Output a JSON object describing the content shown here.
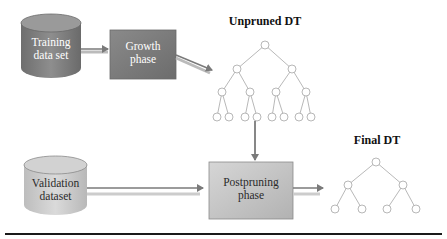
{
  "diagram": {
    "nodes": {
      "training": {
        "label_line1": "Training",
        "label_line2": "data set",
        "shape": "cylinder"
      },
      "growth": {
        "label_line1": "Growth",
        "label_line2": "phase",
        "shape": "box"
      },
      "validation": {
        "label_line1": "Validation",
        "label_line2": "dataset",
        "shape": "cylinder"
      },
      "postpruning": {
        "label_line1": "Postpruning",
        "label_line2": "phase",
        "shape": "box"
      }
    },
    "trees": {
      "unpruned": {
        "title": "Unpruned DT",
        "levels": 4
      },
      "final": {
        "title": "Final DT",
        "levels": 3
      }
    },
    "edges": [
      {
        "from": "Training data set",
        "to": "Growth phase"
      },
      {
        "from": "Growth phase",
        "to": "Unpruned DT"
      },
      {
        "from": "Unpruned DT",
        "to": "Postpruning phase"
      },
      {
        "from": "Validation dataset",
        "to": "Postpruning phase"
      },
      {
        "from": "Postpruning phase",
        "to": "Final DT"
      }
    ],
    "colors": {
      "dark_fill": "#7a7a7a",
      "light_fill": "#c4c4c4",
      "arrow": "#808080",
      "rule": "#1a1a1a"
    }
  }
}
